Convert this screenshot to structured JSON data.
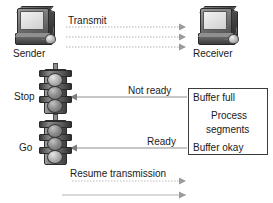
{
  "diagram": {
    "nodes": {
      "sender": {
        "label": "Sender",
        "icon": "computer-icon"
      },
      "receiver": {
        "label": "Receiver",
        "icon": "computer-icon"
      },
      "stop_light": {
        "label": "Stop",
        "icon": "traffic-light-icon",
        "lit_lamp": "top"
      },
      "go_light": {
        "label": "Go",
        "icon": "traffic-light-icon",
        "lit_lamp": "bottom"
      }
    },
    "flows": [
      {
        "id": "transmit",
        "label": "Transmit",
        "direction": "left-to-right",
        "style": "dashed-gray",
        "count": 3
      },
      {
        "id": "not-ready",
        "label": "Not ready",
        "direction": "right-to-left",
        "style": "solid-gray"
      },
      {
        "id": "ready",
        "label": "Ready",
        "direction": "right-to-left",
        "style": "solid-gray"
      },
      {
        "id": "resume-transmission",
        "label": "Resume transmission",
        "direction": "left-to-right",
        "style": "dashed-gray",
        "count": 2
      }
    ],
    "buffer_box": {
      "top_label": "Buffer full",
      "middle_label_line1": "Process",
      "middle_label_line2": "segments",
      "bottom_label": "Buffer okay",
      "arrow": "down-arrow-icon",
      "border_color": "#3b3b3b"
    },
    "colors": {
      "arrow_gray": "#9b9b9b",
      "arrow_dark": "#8a8a8a",
      "text": "#1a1a1a",
      "background": "#ffffff"
    }
  }
}
